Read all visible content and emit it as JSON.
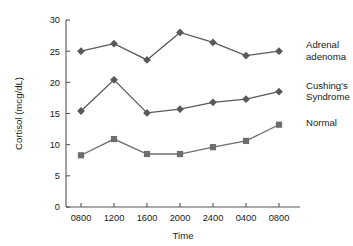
{
  "chart_data": {
    "type": "line",
    "title": "",
    "subtitle": "",
    "xlabel": "Time",
    "ylabel": "Cortisol (mcg/dL)",
    "categories": [
      "0800",
      "1200",
      "1600",
      "2000",
      "2400",
      "0400",
      "0800"
    ],
    "ylim": [
      0,
      30
    ],
    "yticks": [
      0,
      5,
      10,
      15,
      20,
      25,
      30
    ],
    "grid": false,
    "legend_position": "right-inline",
    "series": [
      {
        "name": "Adrenal adenoma",
        "label_line1": "Adrenal",
        "label_line2": "adenoma",
        "marker": "diamond",
        "color": "#595959",
        "values": [
          25.0,
          26.2,
          23.6,
          28.0,
          26.4,
          24.3,
          25.0
        ]
      },
      {
        "name": "Cushing's Syndrome",
        "label_line1": "Cushing's",
        "label_line2": "Syndrome",
        "marker": "diamond",
        "color": "#595959",
        "values": [
          15.4,
          20.4,
          15.1,
          15.7,
          16.8,
          17.3,
          18.5
        ]
      },
      {
        "name": "Normal",
        "label_line1": "Normal",
        "label_line2": "",
        "marker": "square",
        "color": "#6e6e6e",
        "values": [
          8.3,
          10.9,
          8.5,
          8.5,
          9.6,
          10.6,
          13.2
        ]
      }
    ]
  },
  "axis": {
    "y_tick_labels": [
      "0",
      "5",
      "10",
      "15",
      "20",
      "25",
      "30"
    ],
    "x_tick_labels": [
      "0800",
      "1200",
      "1600",
      "2000",
      "2400",
      "0400",
      "0800"
    ],
    "x_title": "Time",
    "y_title": "Cortisol (mcg/dL)"
  },
  "colors": {
    "axis": "#555555",
    "series_dark": "#595959",
    "series_light": "#6e6e6e",
    "text": "#1a1a1a",
    "background": "#ffffff"
  }
}
